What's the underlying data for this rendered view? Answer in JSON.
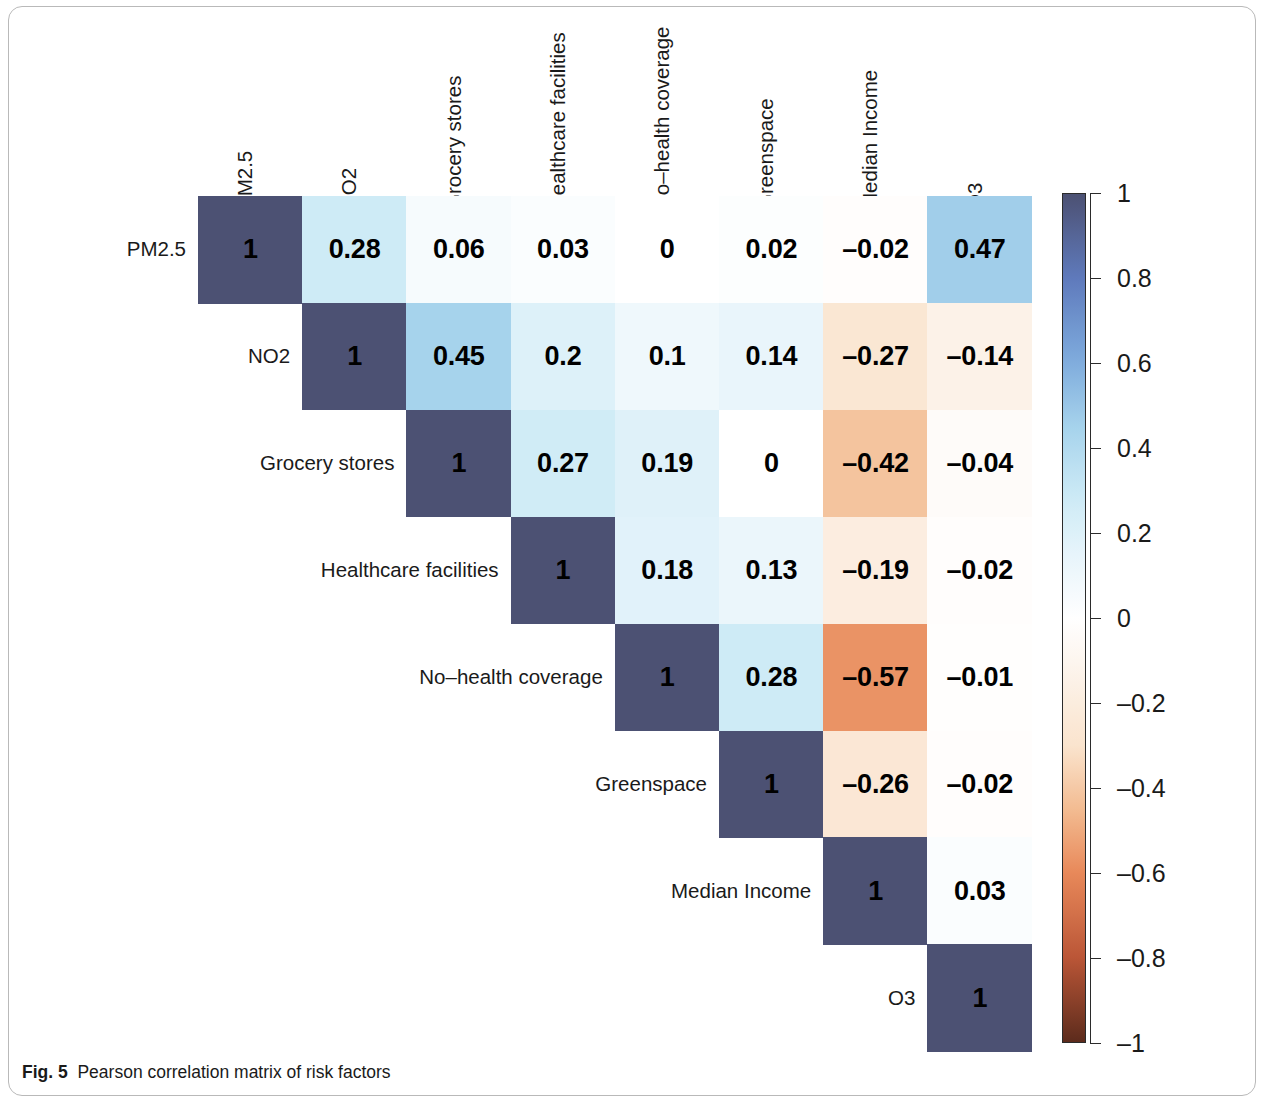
{
  "caption": {
    "label": "Fig. 5",
    "text": "Pearson correlation matrix of risk factors"
  },
  "chart_data": {
    "type": "heatmap",
    "subtype": "correlation-matrix-upper-triangle",
    "title": "Pearson correlation matrix of risk factors",
    "xlabel": "",
    "ylabel": "",
    "grid": false,
    "variables": [
      "PM2.5",
      "NO2",
      "Grocery stores",
      "Healthcare facilities",
      "No–health coverage",
      "Greenspace",
      "Median Income",
      "O3"
    ],
    "categories": [
      "PM2.5",
      "NO2",
      "Grocery stores",
      "Healthcare facilities",
      "No–health coverage",
      "Greenspace",
      "Median Income",
      "O3"
    ],
    "row_labels": [
      "PM2.5",
      "NO2",
      "Grocery stores",
      "Healthcare facilities",
      "No–health coverage",
      "Greenspace",
      "Median Income",
      "O3"
    ],
    "col_labels": [
      "PM2.5",
      "NO2",
      "Grocery stores",
      "Healthcare facilities",
      "No–health coverage",
      "Greenspace",
      "Median Income",
      "O3"
    ],
    "matrix": [
      [
        1,
        0.28,
        0.06,
        0.03,
        0,
        0.02,
        -0.02,
        0.47
      ],
      [
        null,
        1,
        0.45,
        0.2,
        0.1,
        0.14,
        -0.27,
        -0.14
      ],
      [
        null,
        null,
        1,
        0.27,
        0.19,
        0,
        -0.42,
        -0.04
      ],
      [
        null,
        null,
        null,
        1,
        0.18,
        0.13,
        -0.19,
        -0.02
      ],
      [
        null,
        null,
        null,
        null,
        1,
        0.28,
        -0.57,
        -0.01
      ],
      [
        null,
        null,
        null,
        null,
        null,
        1,
        -0.26,
        -0.02
      ],
      [
        null,
        null,
        null,
        null,
        null,
        null,
        1,
        0.03
      ],
      [
        null,
        null,
        null,
        null,
        null,
        null,
        null,
        1
      ]
    ],
    "cell_labels": [
      [
        "1",
        "0.28",
        "0.06",
        "0.03",
        "0",
        "0.02",
        "–0.02",
        "0.47"
      ],
      [
        null,
        "1",
        "0.45",
        "0.2",
        "0.1",
        "0.14",
        "–0.27",
        "–0.14"
      ],
      [
        null,
        null,
        "1",
        "0.27",
        "0.19",
        "0",
        "–0.42",
        "–0.04"
      ],
      [
        null,
        null,
        null,
        "1",
        "0.18",
        "0.13",
        "–0.19",
        "–0.02"
      ],
      [
        null,
        null,
        null,
        null,
        "1",
        "0.28",
        "–0.57",
        "–0.01"
      ],
      [
        null,
        null,
        null,
        null,
        null,
        "1",
        "–0.26",
        "–0.02"
      ],
      [
        null,
        null,
        null,
        null,
        null,
        null,
        "1",
        "0.03"
      ],
      [
        null,
        null,
        null,
        null,
        null,
        null,
        null,
        "1"
      ]
    ],
    "colorbar": {
      "min": -1,
      "max": 1,
      "ticks": [
        1,
        0.8,
        0.6,
        0.4,
        0.2,
        0,
        -0.2,
        -0.4,
        -0.6,
        -0.8,
        -1
      ],
      "tick_labels": [
        "1",
        "0.8",
        "0.6",
        "0.4",
        "0.2",
        "0",
        "–0.2",
        "–0.4",
        "–0.6",
        "–0.8",
        "–1"
      ],
      "position": "right",
      "orientation": "vertical"
    },
    "colors": {
      "positive_extreme": "#4c5173",
      "positive_mid": "#6f8fc9",
      "positive_light": "#a8d3ec",
      "neutral": "#ffffff",
      "negative_light": "#f7e0cb",
      "negative_mid": "#e8895a",
      "negative_extreme": "#5c2b1c",
      "text": "#000000",
      "frame": "#b9b9b9"
    }
  }
}
